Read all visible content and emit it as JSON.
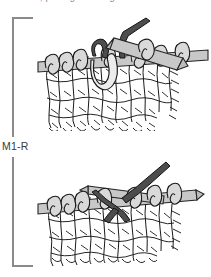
{
  "page": {
    "background_color": "#ffffff",
    "width": 211,
    "height": 277
  },
  "caption": {
    "text": "stitches, pulling it through from back to front.",
    "note": "top caption line cropped off by screenshot edge; only descender tips visible",
    "color": "#8d8d8d"
  },
  "bracket": {
    "label": "M1-R",
    "label_color": "#3a3a3a",
    "line_color": "#8a8a8a",
    "orientation": "vertical-left-bracket",
    "top_y": 18,
    "bottom_y": 266,
    "spine_x": 13,
    "arm_length": 20,
    "gap_top": 137,
    "gap_bottom": 157
  },
  "figures": [
    {
      "id": "figure-top",
      "name": "step-1-lifting-running-thread",
      "description": "Knitting needle holding stitches with right needle tip inserted under the running thread between stitches; dark working yarn strand passes over the needle.",
      "needle_color": "#c9c9c9",
      "needle_outline": "#2b2b2b",
      "yarn_color": "#d8d8d8",
      "yarn_outline": "#1f1f1f",
      "dark_yarn_color": "#4a4a4a",
      "stitch_count": 7
    },
    {
      "id": "figure-bottom",
      "name": "step-2-new-stitch-on-needle",
      "description": "Two needles crossing with the lifted loop transferred; dark working yarn drawn through to form the new right-leaning made stitch.",
      "needle_color": "#c9c9c9",
      "needle_outline": "#2b2b2b",
      "yarn_color": "#d8d8d8",
      "yarn_outline": "#1f1f1f",
      "dark_yarn_color": "#4a4a4a",
      "stitch_count": 7
    }
  ],
  "colors": {
    "yarn_fill": "#d9d9d9",
    "yarn_stroke": "#1a1a1a",
    "needle_fill": "#c8c8c8",
    "needle_stroke": "#262626",
    "dark_yarn_fill": "#4d4d4d",
    "dark_yarn_stroke": "#1a1a1a",
    "bracket": "#8a8a8a",
    "text": "#3a3a3a"
  }
}
